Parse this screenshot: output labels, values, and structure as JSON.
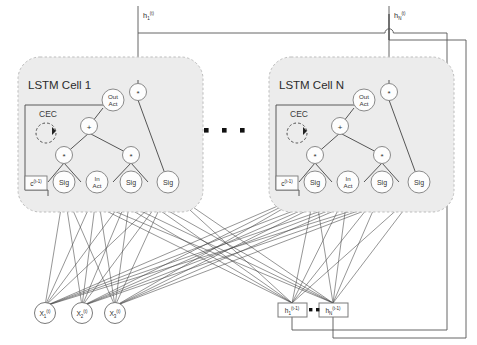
{
  "figure": {
    "background": "#ffffff",
    "cell_fill": "#ececec",
    "cell_stroke": "#b9b9b9",
    "node_fill": "#fdfdfd",
    "node_stroke": "#8a8a8a",
    "edge_color": "#3a3a3a"
  },
  "cells": [
    {
      "id": "cell-1",
      "label": "LSTM Cell 1",
      "cec_label": "CEC",
      "state_label": "c",
      "state_sub": "",
      "state_sup": "(t-1)",
      "output_label": "h",
      "output_sub": "1",
      "output_sup": "(t)",
      "nodes": {
        "output_mult": "*",
        "out_act_line1": "Out",
        "out_act_line2": "Act",
        "sum": "+",
        "forget_mult": "*",
        "input_mult": "*",
        "in_act_line1": "In",
        "in_act_line2": "Act",
        "forget_gate": "Sig",
        "input_gate": "Sig",
        "output_gate": "Sig",
        "extra_gate": "Sig"
      }
    },
    {
      "id": "cell-n",
      "label": "LSTM Cell N",
      "cec_label": "CEC",
      "state_label": "c",
      "state_sub": "",
      "state_sup": "(t-1)",
      "output_label": "h",
      "output_sub": "N",
      "output_sup": "(t)",
      "nodes": {
        "output_mult": "*",
        "out_act_line1": "Out",
        "out_act_line2": "Act",
        "sum": "+",
        "forget_mult": "*",
        "input_mult": "*",
        "in_act_line1": "In",
        "in_act_line2": "Act",
        "forget_gate": "Sig",
        "input_gate": "Sig",
        "output_gate": "Sig",
        "extra_gate": "Sig"
      }
    }
  ],
  "ellipsis": {
    "between_cells": "•  •  •",
    "between_recurrent": "•  •  •"
  },
  "inputs": [
    {
      "id": "x1",
      "label": "X",
      "sub": "1",
      "sup": "(t)"
    },
    {
      "id": "x2",
      "label": "X",
      "sub": "2",
      "sup": "(t)"
    },
    {
      "id": "x3",
      "label": "X",
      "sub": "3",
      "sup": "(t)"
    }
  ],
  "recurrent_inputs": [
    {
      "id": "h1-prev",
      "label": "h",
      "sub": "1",
      "sup": "(t-1)"
    },
    {
      "id": "hn-prev",
      "label": "h",
      "sub": "N",
      "sup": "(t-1)"
    }
  ],
  "outputs": [
    {
      "id": "h1-out",
      "label": "h",
      "sub": "1",
      "sup": "(t)"
    },
    {
      "id": "hn-out",
      "label": "h",
      "sub": "N",
      "sup": "(t)"
    }
  ]
}
